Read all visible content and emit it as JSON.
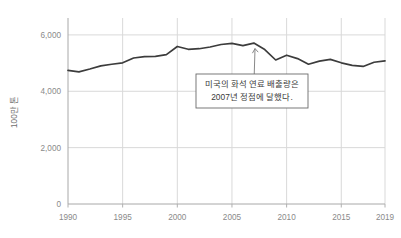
{
  "chart_data": {
    "type": "line",
    "title": "",
    "subtitle": "",
    "xlabel": "",
    "ylabel": "100만 톤",
    "xlim": [
      1990,
      2019
    ],
    "ylim": [
      0,
      6600
    ],
    "grid": true,
    "grid_axes": "both",
    "legend": "none",
    "x_ticks": [
      "1990",
      "1995",
      "2000",
      "2005",
      "2010",
      "2015",
      "2019"
    ],
    "x_tick_values": [
      1990,
      1995,
      2000,
      2005,
      2010,
      2015,
      2019
    ],
    "y_ticks": [
      "0",
      "2,000",
      "4,000",
      "6,000"
    ],
    "y_tick_values": [
      0,
      2000,
      4000,
      6000
    ],
    "series": [
      {
        "name": "미국의 화석 연료 배출량",
        "color": "#3c3c3c",
        "x": [
          1990,
          1991,
          1992,
          1993,
          1994,
          1995,
          1996,
          1997,
          1998,
          1999,
          2000,
          2001,
          2002,
          2003,
          2004,
          2005,
          2006,
          2007,
          2008,
          2009,
          2010,
          2011,
          2012,
          2013,
          2014,
          2015,
          2016,
          2017,
          2018,
          2019
        ],
        "values": [
          4740,
          4690,
          4790,
          4900,
          4960,
          5010,
          5180,
          5230,
          5240,
          5300,
          5590,
          5490,
          5510,
          5570,
          5660,
          5700,
          5620,
          5710,
          5480,
          5110,
          5280,
          5160,
          4960,
          5070,
          5130,
          5010,
          4920,
          4880,
          5030,
          5080
        ],
        "annotations": [
          {
            "target_x": 2007,
            "target_y": 5710,
            "lines": [
              "미국의 화석 연료 배출량은",
              "2007년 정점에 달했다."
            ]
          }
        ]
      }
    ]
  },
  "annotation": {
    "line1": "미국의 화석 연료 배출량은",
    "line2": "2007년 정점에 달했다."
  },
  "colors": {
    "series_line": "#3c3c3c",
    "grid": "#d9d9d9",
    "axis": "#b0b0b0",
    "tick_text": "#8a8a8a",
    "annotation_border": "#6b6b6b",
    "annotation_text": "#3a3a3a",
    "background": "#ffffff"
  }
}
